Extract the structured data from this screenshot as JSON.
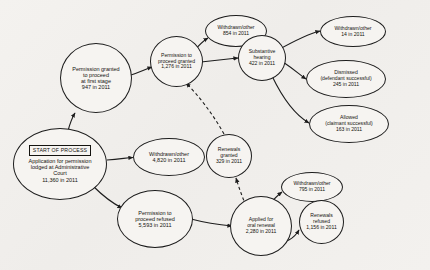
{
  "diagram": {
    "type": "flowchart",
    "start_badge": "START OF PROCESS",
    "nodes": [
      {
        "id": "application",
        "name": "application-lodged",
        "lines": [
          "Application for permission",
          "lodged at Administrative",
          "Court",
          "11,360 in 2011"
        ],
        "label": "Application for permission lodged at Administrative Court",
        "value": "11,360 in 2011",
        "count": 11360,
        "year": 2011,
        "has_badge": true
      },
      {
        "id": "withdrawn_application",
        "name": "withdrawn-other-application",
        "lines": [
          "Withdrawn/other",
          "4,820 in 2011"
        ],
        "label": "Withdrawn/other",
        "value": "4,820 in 2011",
        "count": 4820,
        "year": 2011
      },
      {
        "id": "permission_granted_first",
        "name": "permission-granted-first-stage",
        "lines": [
          "Permission granted",
          "to proceed",
          "at first stage",
          "947 in 2011"
        ],
        "label": "Permission granted to proceed at first stage",
        "value": "947 in 2011",
        "count": 947,
        "year": 2011
      },
      {
        "id": "permission_refused",
        "name": "permission-to-proceed-refused",
        "lines": [
          "Permission to",
          "proceed refused",
          "5,593 in 2011"
        ],
        "label": "Permission to proceed refused",
        "value": "5,593 in 2011",
        "count": 5593,
        "year": 2011
      },
      {
        "id": "proceed_granted",
        "name": "permission-to-proceed-granted",
        "lines": [
          "Permission to",
          "proceed granted",
          "1,276 in 2011"
        ],
        "label": "Permission to proceed granted",
        "value": "1,276 in 2011",
        "count": 1276,
        "year": 2011
      },
      {
        "id": "withdrawn_granted",
        "name": "withdrawn-other-after-granted",
        "lines": [
          "Withdrawn/other",
          "854 in 2011"
        ],
        "label": "Withdrawn/other",
        "value": "854 in 2011",
        "count": 854,
        "year": 2011
      },
      {
        "id": "substantive_hearing",
        "name": "substantive-hearing",
        "lines": [
          "Substantive",
          "hearing",
          "422 in 2011"
        ],
        "label": "Substantive hearing",
        "value": "422 in 2011",
        "count": 422,
        "year": 2011
      },
      {
        "id": "withdrawn_hearing",
        "name": "withdrawn-other-after-hearing",
        "lines": [
          "Withdrawn/other",
          "14 in 2011"
        ],
        "label": "Withdrawn/other",
        "value": "14 in 2011",
        "count": 14,
        "year": 2011
      },
      {
        "id": "dismissed",
        "name": "dismissed-defendant-successful",
        "lines": [
          "Dismissed",
          "(defendant successful)",
          "245 in 2011"
        ],
        "label": "Dismissed (defendant successful)",
        "value": "245 in 2011",
        "count": 245,
        "year": 2011
      },
      {
        "id": "allowed",
        "name": "allowed-claimant-successful",
        "lines": [
          "Allowed",
          "(claimant successful)",
          "163 in 2011"
        ],
        "label": "Allowed (claimant successful)",
        "value": "163 in 2011",
        "count": 163,
        "year": 2011
      },
      {
        "id": "oral_renewal",
        "name": "applied-for-oral-renewal",
        "lines": [
          "Applied for",
          "oral renewal",
          "2,280 in 2011"
        ],
        "label": "Applied for oral renewal",
        "value": "2,280 in 2011",
        "count": 2280,
        "year": 2011
      },
      {
        "id": "withdrawn_renewal",
        "name": "withdrawn-other-after-renewal",
        "lines": [
          "Withdrawn/other",
          "795 in 2011"
        ],
        "label": "Withdrawn/other",
        "value": "795 in 2011",
        "count": 795,
        "year": 2011
      },
      {
        "id": "renewals_refused",
        "name": "renewals-refused",
        "lines": [
          "Renewals",
          "refused",
          "1,156 in 2011"
        ],
        "label": "Renewals refused",
        "value": "1,156 in 2011",
        "count": 1156,
        "year": 2011
      },
      {
        "id": "renewals_granted",
        "name": "renewals-granted",
        "lines": [
          "Renewals",
          "granted",
          "329 in 2011"
        ],
        "label": "Renewals granted",
        "value": "329 in 2011",
        "count": 329,
        "year": 2011
      }
    ],
    "edges": [
      {
        "from": "application",
        "to": "withdrawn_application",
        "style": "solid"
      },
      {
        "from": "application",
        "to": "permission_granted_first",
        "style": "solid"
      },
      {
        "from": "application",
        "to": "permission_refused",
        "style": "solid"
      },
      {
        "from": "permission_granted_first",
        "to": "proceed_granted",
        "style": "solid"
      },
      {
        "from": "proceed_granted",
        "to": "withdrawn_granted",
        "style": "solid"
      },
      {
        "from": "proceed_granted",
        "to": "substantive_hearing",
        "style": "solid"
      },
      {
        "from": "substantive_hearing",
        "to": "withdrawn_hearing",
        "style": "solid"
      },
      {
        "from": "substantive_hearing",
        "to": "dismissed",
        "style": "solid"
      },
      {
        "from": "substantive_hearing",
        "to": "allowed",
        "style": "solid"
      },
      {
        "from": "permission_refused",
        "to": "oral_renewal",
        "style": "solid"
      },
      {
        "from": "oral_renewal",
        "to": "withdrawn_renewal",
        "style": "solid"
      },
      {
        "from": "oral_renewal",
        "to": "renewals_refused",
        "style": "solid"
      },
      {
        "from": "oral_renewal",
        "to": "renewals_granted",
        "style": "dashed"
      },
      {
        "from": "renewals_granted",
        "to": "proceed_granted",
        "style": "dashed"
      }
    ],
    "colors": {
      "background": "#f2f0ed",
      "node_fill": "#f6f4f1",
      "stroke": "#1d1d1d",
      "text": "#14130f"
    }
  }
}
